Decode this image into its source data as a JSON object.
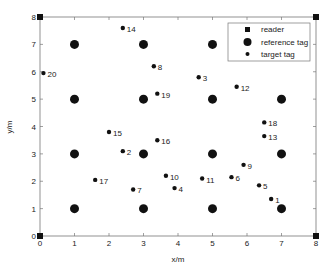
{
  "chart_data": {
    "type": "scatter",
    "title": "",
    "xlabel": "x/m",
    "ylabel": "y/m",
    "xlim": [
      0,
      8
    ],
    "ylim": [
      0,
      8
    ],
    "xticks": [
      "0",
      "1",
      "2",
      "3",
      "4",
      "5",
      "6",
      "7",
      "8"
    ],
    "yticks": [
      "0",
      "1",
      "2",
      "3",
      "4",
      "5",
      "6",
      "7",
      "8"
    ],
    "grid": false,
    "legend": {
      "position": "upper right",
      "entries": [
        "reader",
        "reference tag",
        "target tag"
      ]
    },
    "series": [
      {
        "name": "reader",
        "marker": "square",
        "points": [
          {
            "x": 0,
            "y": 0
          },
          {
            "x": 8,
            "y": 0
          },
          {
            "x": 0,
            "y": 8
          },
          {
            "x": 8,
            "y": 8
          }
        ]
      },
      {
        "name": "reference tag",
        "marker": "large-circle",
        "points": [
          {
            "x": 1,
            "y": 1
          },
          {
            "x": 3,
            "y": 1
          },
          {
            "x": 5,
            "y": 1
          },
          {
            "x": 7,
            "y": 1
          },
          {
            "x": 1,
            "y": 3
          },
          {
            "x": 3,
            "y": 3
          },
          {
            "x": 5,
            "y": 3
          },
          {
            "x": 7,
            "y": 3
          },
          {
            "x": 1,
            "y": 5
          },
          {
            "x": 3,
            "y": 5
          },
          {
            "x": 5,
            "y": 5
          },
          {
            "x": 7,
            "y": 5
          },
          {
            "x": 1,
            "y": 7
          },
          {
            "x": 3,
            "y": 7
          },
          {
            "x": 5,
            "y": 7
          }
        ]
      },
      {
        "name": "target tag",
        "marker": "small-circle",
        "points": [
          {
            "label": "1",
            "x": 6.7,
            "y": 1.35
          },
          {
            "label": "2",
            "x": 2.4,
            "y": 3.1
          },
          {
            "label": "3",
            "x": 4.6,
            "y": 5.8
          },
          {
            "label": "4",
            "x": 3.9,
            "y": 1.75
          },
          {
            "label": "5",
            "x": 6.35,
            "y": 1.85
          },
          {
            "label": "6",
            "x": 5.55,
            "y": 2.15
          },
          {
            "label": "7",
            "x": 2.7,
            "y": 1.7
          },
          {
            "label": "8",
            "x": 3.3,
            "y": 6.2
          },
          {
            "label": "9",
            "x": 5.9,
            "y": 2.6
          },
          {
            "label": "10",
            "x": 3.65,
            "y": 2.2
          },
          {
            "label": "11",
            "x": 4.7,
            "y": 2.1
          },
          {
            "label": "12",
            "x": 5.7,
            "y": 5.45
          },
          {
            "label": "13",
            "x": 6.5,
            "y": 3.65
          },
          {
            "label": "14",
            "x": 2.4,
            "y": 7.6
          },
          {
            "label": "15",
            "x": 2.0,
            "y": 3.8
          },
          {
            "label": "16",
            "x": 3.4,
            "y": 3.5
          },
          {
            "label": "17",
            "x": 1.6,
            "y": 2.05
          },
          {
            "label": "18",
            "x": 6.5,
            "y": 4.15
          },
          {
            "label": "19",
            "x": 3.4,
            "y": 5.2
          },
          {
            "label": "20",
            "x": 0.1,
            "y": 5.95
          }
        ]
      }
    ]
  },
  "colors": {
    "marker": "#111111",
    "axis": "#555555",
    "background": "#ffffff"
  }
}
